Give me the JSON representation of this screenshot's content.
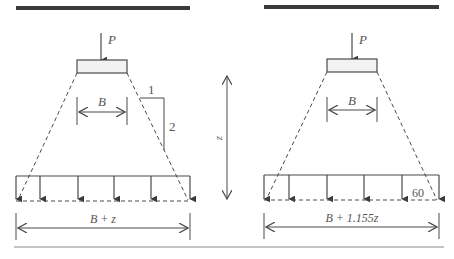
{
  "diagram": {
    "colors": {
      "line": "#4a4a4a",
      "thick_bar": "#3a3a3a",
      "footing_fill": "#f2f2f2",
      "text": "#555555"
    },
    "left": {
      "load_label": "P",
      "width_label": "B",
      "slope_horizontal": "1",
      "slope_vertical": "2",
      "base_width_label": "B + z"
    },
    "center": {
      "depth_label": "z"
    },
    "right": {
      "load_label": "P",
      "width_label": "B",
      "angle_label": "60",
      "base_width_label": "B + 1.155z"
    }
  }
}
